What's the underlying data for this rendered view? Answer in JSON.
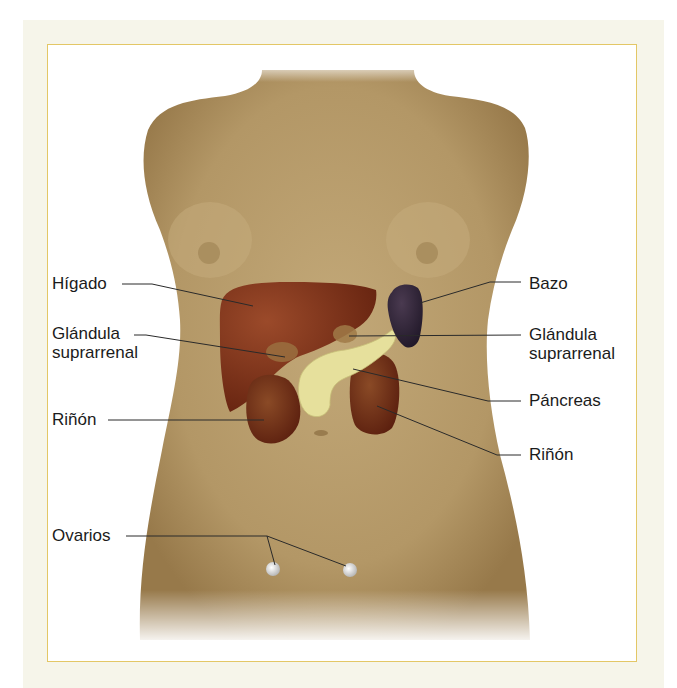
{
  "figure": {
    "colors": {
      "outer_panel": "#f6f5ea",
      "frame_border": "#e3c766",
      "skin": "#b59a6a",
      "liver": "#7a3018",
      "kidney": "#6e2a18",
      "spleen": "#2e2236",
      "pancreas": "#e6e09c",
      "adrenal": "#a9824a",
      "ovary": "#f0f0f0",
      "leader_line": "#2a2a2a"
    }
  },
  "labels": {
    "left": [
      {
        "id": "higado",
        "line1": "Hígado",
        "line2": ""
      },
      {
        "id": "glandula-left",
        "line1": "Glándula",
        "line2": "suprarrenal"
      },
      {
        "id": "rinon-left",
        "line1": "Riñón",
        "line2": ""
      },
      {
        "id": "ovarios",
        "line1": "Ovarios",
        "line2": ""
      }
    ],
    "right": [
      {
        "id": "bazo",
        "line1": "Bazo",
        "line2": ""
      },
      {
        "id": "glandula-right",
        "line1": "Glándula",
        "line2": "suprarrenal"
      },
      {
        "id": "pancreas",
        "line1": "Páncreas",
        "line2": ""
      },
      {
        "id": "rinon-right",
        "line1": "Riñón",
        "line2": ""
      }
    ]
  }
}
